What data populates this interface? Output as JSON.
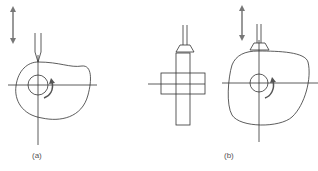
{
  "figure": {
    "panels": [
      {
        "id": "a",
        "label": "(a)",
        "description": "knife-edge follower on disk cam"
      },
      {
        "id": "b",
        "label": "(b)",
        "description": "flat-faced follower on disk cam, side and front views"
      }
    ],
    "colors": {
      "line": "#333333",
      "arrow": "#777777",
      "label": "#555555"
    }
  }
}
